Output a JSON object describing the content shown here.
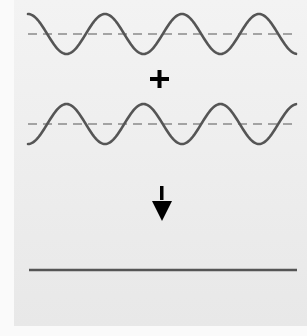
{
  "diagram": {
    "colors": {
      "background": "#ececec",
      "wave": "#555555",
      "dashed_axis": "#8a8a8a",
      "symbol": "#000000"
    },
    "wave_1": {
      "label": "Wave 1",
      "phase": "starts at crest",
      "cycles": 3.25
    },
    "operator": "+",
    "wave_2": {
      "label": "Wave 2",
      "phase": "starts at trough (180° out of phase)",
      "cycles": 3.25
    },
    "result_arrow": "↓",
    "result": {
      "label": "Resultant wave: flat line (zero amplitude)"
    }
  }
}
